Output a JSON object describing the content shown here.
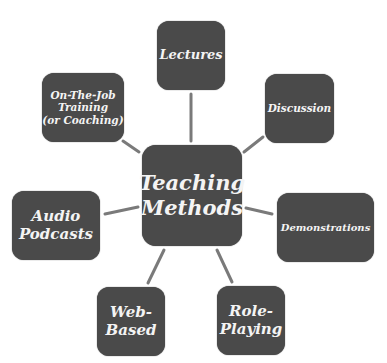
{
  "diagram": {
    "type": "hub-and-spoke",
    "colors": {
      "node_fill": "#4a4a4a",
      "node_text": "#f4f4f4",
      "connector": "#7a7a7a",
      "background": "#ffffff"
    },
    "center": {
      "label": "Teaching\nMethods"
    },
    "nodes": [
      {
        "id": "lectures",
        "label": "Lectures"
      },
      {
        "id": "discussion",
        "label": "Discussion"
      },
      {
        "id": "demonstrations",
        "label": "Demonstrations"
      },
      {
        "id": "role-playing",
        "label": "Role-\nPlaying"
      },
      {
        "id": "web-based",
        "label": "Web-\nBased"
      },
      {
        "id": "audio-podcasts",
        "label": "Audio\nPodcasts"
      },
      {
        "id": "on-the-job",
        "label": "On-The-Job\nTraining\n(or Coaching)"
      }
    ]
  }
}
